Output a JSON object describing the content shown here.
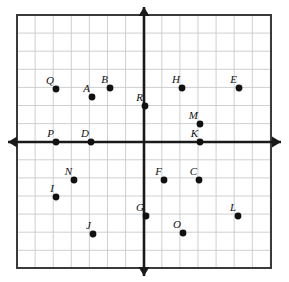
{
  "figure": {
    "kind": "coordinate-grid-point-plot",
    "width": 289,
    "height": 282,
    "background_color": "#ffffff",
    "grid": {
      "left": 17,
      "top": 15,
      "right": 271,
      "bottom": 268,
      "cell_size": 18.1,
      "columns": 14,
      "rows": 14,
      "line_color": "#c9c9c9",
      "border_color": "#3a3a3a",
      "border_width": 2
    },
    "axes": {
      "origin_x": 144,
      "origin_y": 142,
      "color": "#1a1a1a",
      "line_width": 2.6,
      "x_axis_left_tip": 8,
      "x_axis_right_tip": 281,
      "y_axis_top_tip": 7,
      "y_axis_bottom_tip": 276,
      "arrow_head_length": 9,
      "arrow_head_half_width": 5.5
    },
    "point_style": {
      "radius": 3.4,
      "color": "#111111"
    }
  },
  "points": [
    {
      "label": "Q",
      "px": 56,
      "py": 89,
      "gx": -5,
      "gy": 3,
      "label_dx": -2,
      "label_dy": -3
    },
    {
      "label": "A",
      "px": 92,
      "py": 97,
      "gx": -3,
      "gy": 2,
      "label_dx": -2,
      "label_dy": -3
    },
    {
      "label": "B",
      "px": 110,
      "py": 88,
      "gx": -2,
      "gy": 3,
      "label_dx": -2,
      "label_dy": -3
    },
    {
      "label": "R",
      "px": 145,
      "py": 106,
      "gx": 0,
      "gy": 2,
      "label_dx": -2,
      "label_dy": -3
    },
    {
      "label": "H",
      "px": 182,
      "py": 88,
      "gx": 2,
      "gy": 3,
      "label_dx": -2,
      "label_dy": -3
    },
    {
      "label": "E",
      "px": 239,
      "py": 88,
      "gx": 5,
      "gy": 3,
      "label_dx": -2,
      "label_dy": -3
    },
    {
      "label": "M",
      "px": 200,
      "py": 124,
      "gx": 3,
      "gy": 1,
      "label_dx": -2,
      "label_dy": -3
    },
    {
      "label": "K",
      "px": 200,
      "py": 142,
      "gx": 3,
      "gy": 0,
      "label_dx": -2,
      "label_dy": -3
    },
    {
      "label": "P",
      "px": 56,
      "py": 142,
      "gx": -5,
      "gy": 0,
      "label_dx": -2,
      "label_dy": -3
    },
    {
      "label": "D",
      "px": 91,
      "py": 142,
      "gx": -3,
      "gy": 0,
      "label_dx": -2,
      "label_dy": -3
    },
    {
      "label": "N",
      "px": 74,
      "py": 180,
      "gx": -4,
      "gy": -2,
      "label_dx": -2,
      "label_dy": -3
    },
    {
      "label": "I",
      "px": 56,
      "py": 197,
      "gx": -5,
      "gy": -3,
      "label_dx": -2,
      "label_dy": -3
    },
    {
      "label": "F",
      "px": 164,
      "py": 180,
      "gx": 1,
      "gy": -2,
      "label_dx": -2,
      "label_dy": -3
    },
    {
      "label": "C",
      "px": 199,
      "py": 180,
      "gx": 3,
      "gy": -2,
      "label_dx": -2,
      "label_dy": -3
    },
    {
      "label": "G",
      "px": 146,
      "py": 216,
      "gx": 0,
      "gy": -4,
      "label_dx": -2,
      "label_dy": -3
    },
    {
      "label": "L",
      "px": 238,
      "py": 216,
      "gx": 5,
      "gy": -4,
      "label_dx": -2,
      "label_dy": -3
    },
    {
      "label": "J",
      "px": 93,
      "py": 234,
      "gx": -3,
      "gy": -5,
      "label_dx": -2,
      "label_dy": -3
    },
    {
      "label": "O",
      "px": 183,
      "py": 233,
      "gx": 2,
      "gy": -5,
      "label_dx": -2,
      "label_dy": -3
    }
  ]
}
